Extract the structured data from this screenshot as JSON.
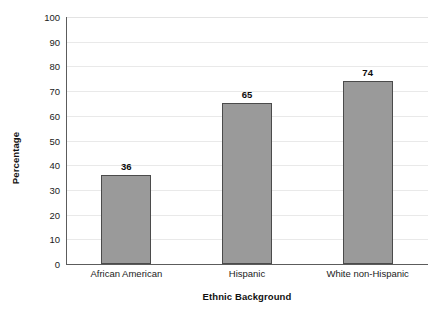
{
  "chart_data": {
    "type": "bar",
    "title": "",
    "subtitle": "",
    "categories": [
      "African American",
      "Hispanic",
      "White non-Hispanic"
    ],
    "values": [
      36,
      65,
      74
    ],
    "data_labels": [
      "36",
      "65",
      "74"
    ],
    "xlabel": "Ethnic Background",
    "ylabel": "Percentage",
    "ylim": [
      0,
      100
    ],
    "ytick_labels": [
      "0",
      "10",
      "20",
      "30",
      "40",
      "50",
      "60",
      "70",
      "80",
      "90",
      "100"
    ],
    "ytick_values": [
      0,
      10,
      20,
      30,
      40,
      50,
      60,
      70,
      80,
      90,
      100
    ],
    "grid": "horizontal",
    "legend": "none",
    "bar_fill_color": "#9a9a9a",
    "bar_border_color": "#4b4b4b",
    "gridline_color": "#e9e9e9",
    "axis_color": "#5c5c5c",
    "background_color": "#ffffff"
  }
}
